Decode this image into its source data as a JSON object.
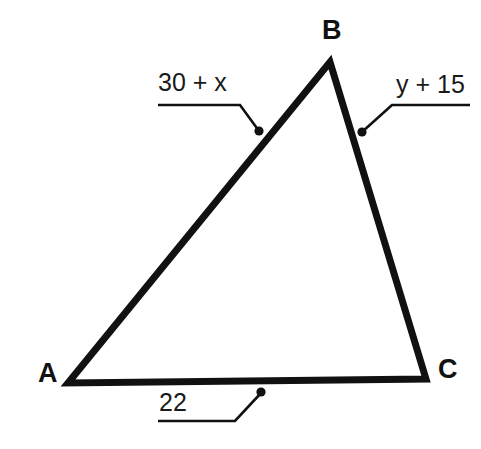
{
  "diagram": {
    "type": "triangle-with-side-labels",
    "background_color": "#ffffff",
    "stroke_color": "#111111",
    "vertices": [
      {
        "name": "A",
        "label": "A",
        "x": 68,
        "y": 383
      },
      {
        "name": "B",
        "label": "B",
        "x": 330,
        "y": 62
      },
      {
        "name": "C",
        "label": "C",
        "x": 426,
        "y": 379
      }
    ],
    "sides": [
      {
        "name": "side-AB",
        "from": "A",
        "to": "B",
        "label": "30 + x",
        "leader": {
          "underline_start_x": 158,
          "underline_end_x": 240,
          "underline_y": 105,
          "dot_x": 259,
          "dot_y": 131
        }
      },
      {
        "name": "side-BC",
        "from": "B",
        "to": "C",
        "label": "y + 15",
        "leader": {
          "underline_start_x": 392,
          "underline_end_x": 470,
          "underline_y": 105,
          "dot_x": 362,
          "dot_y": 132
        }
      },
      {
        "name": "side-AC",
        "from": "A",
        "to": "C",
        "label": "22",
        "leader": {
          "underline_start_x": 158,
          "underline_end_x": 235,
          "underline_y": 421,
          "dot_x": 261,
          "dot_y": 392
        }
      }
    ]
  },
  "labels": {
    "vertex_a": "A",
    "vertex_b": "B",
    "vertex_c": "C",
    "side_ab": "30 + x",
    "side_bc": "y + 15",
    "side_ac": "22"
  }
}
